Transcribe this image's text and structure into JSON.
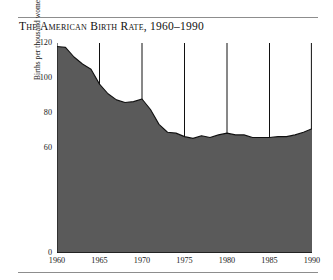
{
  "figure": {
    "title": "The American Birth Rate, 1960–1990",
    "rule_color": "#8d8d8d",
    "background": "#ffffff"
  },
  "chart_data": {
    "type": "area",
    "title": "The American Birth Rate, 1960–1990",
    "xlabel": "",
    "ylabel": "Births per thousand women 15–44 years old",
    "xlim": [
      1960,
      1990
    ],
    "ylim": [
      0,
      120
    ],
    "grid": "vertical gridlines at each labeled x tick",
    "legend": "none",
    "fill_color": "#5a5a5a",
    "line_color": "#111111",
    "x_ticks": [
      1960,
      1965,
      1970,
      1975,
      1980,
      1985,
      1990
    ],
    "x_tick_labels": [
      "1960",
      "1965",
      "1970",
      "1975",
      "1980",
      "1985",
      "1990"
    ],
    "y_ticks_major": [
      0,
      60,
      80,
      100,
      120
    ],
    "y_tick_labels": [
      "0",
      "60",
      "80",
      "100",
      "120"
    ],
    "y_ticks_minor": [
      70,
      90,
      110
    ],
    "x": [
      1960,
      1961,
      1962,
      1963,
      1964,
      1965,
      1966,
      1967,
      1968,
      1969,
      1970,
      1971,
      1972,
      1973,
      1974,
      1975,
      1976,
      1977,
      1978,
      1979,
      1980,
      1981,
      1982,
      1983,
      1984,
      1985,
      1986,
      1987,
      1988,
      1989,
      1990
    ],
    "values": [
      118,
      117.5,
      112,
      108,
      105,
      96.5,
      91,
      87.5,
      86,
      86.5,
      88,
      82,
      73.5,
      69,
      68.5,
      66.5,
      65.5,
      67,
      66,
      67.5,
      68.5,
      67.5,
      67.5,
      66,
      66,
      66,
      66.5,
      66.5,
      67.5,
      69,
      71
    ]
  },
  "axes": {
    "y_title": "Births per thousand women 15–44 years old",
    "y_labels": [
      {
        "text": "120",
        "value": 120
      },
      {
        "text": "100",
        "value": 100
      },
      {
        "text": "80",
        "value": 80
      },
      {
        "text": "60",
        "value": 60
      },
      {
        "text": "0",
        "value": 0
      }
    ],
    "x_labels": [
      {
        "text": "1960",
        "value": 1960
      },
      {
        "text": "1965",
        "value": 1965
      },
      {
        "text": "1970",
        "value": 1970
      },
      {
        "text": "1975",
        "value": 1975
      },
      {
        "text": "1980",
        "value": 1980
      },
      {
        "text": "1985",
        "value": 1985
      },
      {
        "text": "1990",
        "value": 1990
      }
    ]
  }
}
